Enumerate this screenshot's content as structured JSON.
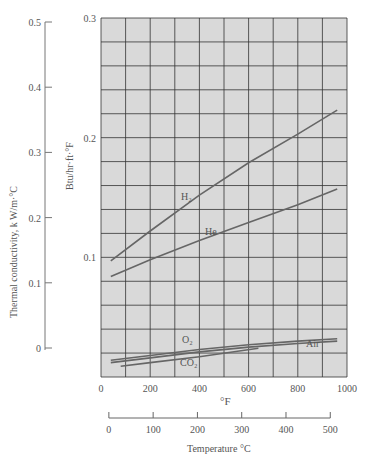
{
  "chart_data": {
    "type": "line",
    "title": "",
    "xlabel": "°F",
    "xlabel_secondary": "Temperature °C",
    "ylabel": "Btu/hr·ft·°F",
    "ylabel_secondary": "Thermal conductivity, k W/m·°C",
    "xlim": [
      0,
      1000
    ],
    "ylim": [
      0,
      0.3
    ],
    "ylim_secondary": [
      0,
      0.5
    ],
    "x_ticks": [
      "0",
      "200",
      "400",
      "600",
      "800",
      "1000"
    ],
    "x_ticks_secondary": [
      "0",
      "100",
      "200",
      "300",
      "400",
      "500"
    ],
    "y_ticks": [
      "0.1",
      "0.2",
      "0.3"
    ],
    "y_ticks_secondary": [
      "0",
      "0.1",
      "0.2",
      "0.3",
      "0.4",
      "0.5"
    ],
    "grid": true,
    "series": [
      {
        "name": "H2",
        "label": "H₂",
        "x": [
          40,
          200,
          400,
          600,
          800,
          960
        ],
        "y": [
          0.097,
          0.122,
          0.152,
          0.179,
          0.203,
          0.223
        ]
      },
      {
        "name": "He",
        "label": "He",
        "x": [
          40,
          200,
          400,
          600,
          800,
          960
        ],
        "y": [
          0.084,
          0.098,
          0.114,
          0.129,
          0.144,
          0.157
        ]
      },
      {
        "name": "O2",
        "label": "O₂",
        "x": [
          40,
          200,
          400,
          600,
          800,
          960
        ],
        "y": [
          0.014,
          0.018,
          0.023,
          0.027,
          0.03,
          0.032
        ]
      },
      {
        "name": "Air",
        "label": "Air",
        "x": [
          40,
          200,
          400,
          600,
          800,
          960
        ],
        "y": [
          0.012,
          0.016,
          0.021,
          0.025,
          0.028,
          0.03
        ]
      },
      {
        "name": "CO2",
        "label": "CO₂",
        "x": [
          80,
          200,
          400,
          640
        ],
        "y": [
          0.009,
          0.012,
          0.017,
          0.024
        ]
      }
    ]
  },
  "labels": {
    "left_axis_title": "Thermal conductivity, k W/m·°C",
    "inner_axis_title": "Btu/hr·ft·°F",
    "x_axis_title": "°F",
    "celsius_axis_title": "Temperature °C",
    "h2": "H₂",
    "he": "He",
    "o2": "O₂",
    "co2": "CO₂",
    "air": "Air"
  }
}
